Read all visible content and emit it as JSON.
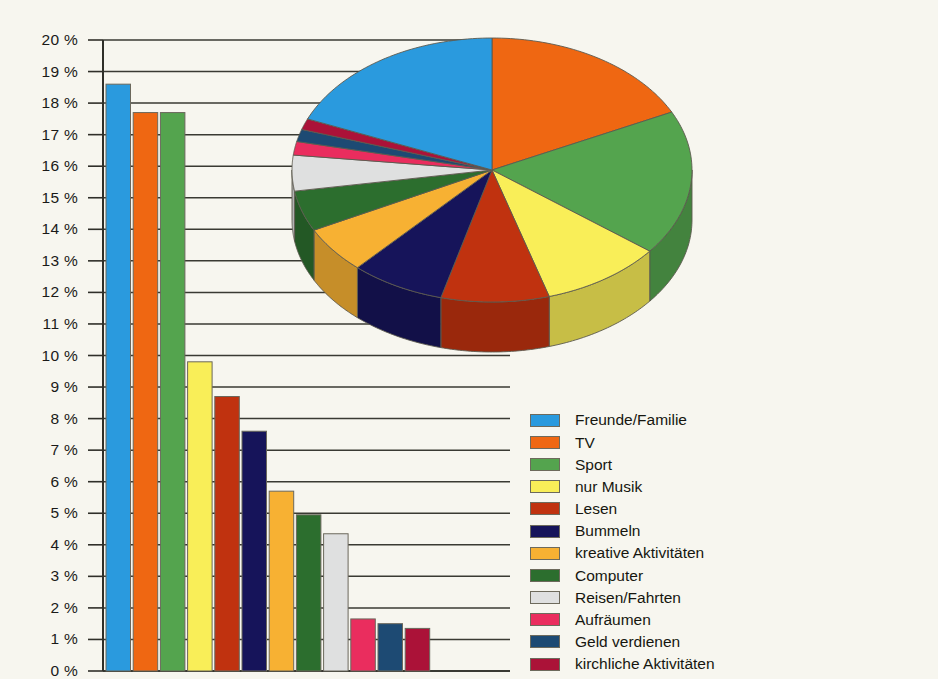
{
  "chart_data": {
    "type": "bar",
    "title": "",
    "subtitle": "",
    "xlabel": "",
    "ylabel": "",
    "unit": "%",
    "ylim": [
      0,
      20
    ],
    "ytick_step": 1,
    "grid": true,
    "ytick_labels": [
      "20 %",
      "19 %",
      "18 %",
      "17 %",
      "16 %",
      "15 %",
      "14 %",
      "13 %",
      "12 %",
      "11 %",
      "10 %",
      "9 %",
      "8 %",
      "7 %",
      "6 %",
      "5 %",
      "4 %",
      "3 %",
      "2 %",
      "1 %",
      "0 %"
    ],
    "ytick_values": [
      20,
      19,
      18,
      17,
      16,
      15,
      14,
      13,
      12,
      11,
      10,
      9,
      8,
      7,
      6,
      5,
      4,
      3,
      2,
      1,
      0
    ],
    "categories": [
      "Freunde/Familie",
      "TV",
      "Sport",
      "nur Musik",
      "Lesen",
      "Bummeln",
      "kreative Aktivitäten",
      "Computer",
      "Reisen/Fahrten",
      "Aufräumen",
      "Geld verdienen",
      "kirchliche Aktivitäten"
    ],
    "values": [
      18.6,
      17.7,
      17.7,
      9.8,
      8.7,
      7.6,
      5.7,
      4.95,
      4.35,
      1.65,
      1.5,
      1.35
    ],
    "colors": [
      "#2a9ade",
      "#ef6712",
      "#54a44e",
      "#f9ee58",
      "#c0320f",
      "#16145a",
      "#f7b133",
      "#2c6e2e",
      "#dfe0e0",
      "#ea2d5e",
      "#1d4a73",
      "#ab1238"
    ],
    "legend_position": "right",
    "legend_entries": [
      {
        "label": "Freunde/Familie",
        "color": "#2a9ade"
      },
      {
        "label": "TV",
        "color": "#ef6712"
      },
      {
        "label": "Sport",
        "color": "#54a44e"
      },
      {
        "label": "nur Musik",
        "color": "#f9ee58"
      },
      {
        "label": "Lesen",
        "color": "#c0320f"
      },
      {
        "label": "Bummeln",
        "color": "#16145a"
      },
      {
        "label": "kreative Aktivitäten",
        "color": "#f7b133"
      },
      {
        "label": "Computer",
        "color": "#2c6e2e"
      },
      {
        "label": "Reisen/Fahrten",
        "color": "#dfe0e0"
      },
      {
        "label": "Aufräumen",
        "color": "#ea2d5e"
      },
      {
        "label": "Geld verdienen",
        "color": "#1d4a73"
      },
      {
        "label": "kirchliche Aktivitäten",
        "color": "#ab1238"
      }
    ],
    "secondary_chart": {
      "type": "pie",
      "style": "3d",
      "labels": [
        "TV",
        "Sport",
        "nur Musik",
        "Lesen",
        "Bummeln",
        "kreative Aktivitäten",
        "Computer",
        "Reisen/Fahrten",
        "Aufräumen",
        "Geld verdienen",
        "kirchliche Aktivitäten",
        "Freunde/Familie"
      ],
      "values": [
        17.7,
        17.7,
        9.8,
        8.7,
        7.6,
        5.7,
        4.95,
        4.35,
        1.65,
        1.5,
        1.35,
        18.6
      ],
      "colors": [
        "#ef6712",
        "#54a44e",
        "#f9ee58",
        "#c0320f",
        "#16145a",
        "#f7b133",
        "#2c6e2e",
        "#dfe0e0",
        "#ea2d5e",
        "#1d4a73",
        "#ab1238",
        "#2a9ade"
      ]
    }
  },
  "caption": {
    "text": ""
  }
}
